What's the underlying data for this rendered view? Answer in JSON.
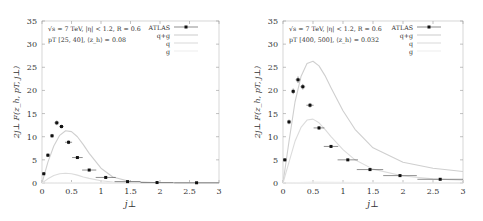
{
  "chart_data": [
    {
      "type": "scatter",
      "title": "",
      "annotation_line1": "√s = 7 TeV, |η| < 1.2, R = 0.6",
      "annotation_line2": "pT [25, 40], ⟨z_h⟩ = 0.08",
      "xlabel": "j⊥",
      "ylabel": "2j⊥ F(z_h, pT, j⊥)",
      "xlim": [
        0,
        3
      ],
      "ylim": [
        0,
        35
      ],
      "xticks": [
        "0",
        "0.5",
        "1",
        "1.5",
        "2",
        "2.5",
        "3"
      ],
      "yticks": [
        "0",
        "5",
        "10",
        "15",
        "20",
        "25",
        "30",
        "35"
      ],
      "legend": [
        "ATLAS",
        "q+g",
        "q",
        "g"
      ],
      "legend_position": "upper right",
      "series": [
        {
          "name": "ATLAS",
          "kind": "points-with-errors",
          "x": [
            0.03,
            0.1,
            0.17,
            0.25,
            0.33,
            0.45,
            0.6,
            0.8,
            1.08,
            1.45,
            1.95,
            2.62
          ],
          "y": [
            2.0,
            6.0,
            10.2,
            13.0,
            12.2,
            8.8,
            5.5,
            2.8,
            1.2,
            0.3,
            0.1,
            0.05
          ],
          "xerr": [
            0.03,
            0.03,
            0.03,
            0.04,
            0.04,
            0.06,
            0.09,
            0.12,
            0.17,
            0.22,
            0.28,
            0.38
          ],
          "yerr": [
            0.3,
            0.4,
            0.4,
            0.5,
            0.4,
            0.4,
            0.3,
            0.2,
            0.1,
            0.05,
            0.05,
            0.05
          ]
        },
        {
          "name": "q+g",
          "kind": "line",
          "x": [
            0,
            0.1,
            0.2,
            0.3,
            0.4,
            0.5,
            0.6,
            0.7,
            0.8,
            1.0,
            1.2,
            1.5,
            2.0,
            2.5,
            3.0
          ],
          "y": [
            0,
            4.5,
            8.0,
            10.3,
            11.3,
            11.1,
            10.0,
            8.3,
            6.4,
            3.2,
            1.3,
            0.3,
            0.05,
            0.01,
            0
          ]
        },
        {
          "name": "q",
          "kind": "line",
          "x": [
            0,
            0.1,
            0.2,
            0.3,
            0.4,
            0.5,
            0.6,
            0.7,
            0.8,
            1.0,
            1.2,
            1.5,
            2.0,
            3.0
          ],
          "y": [
            0,
            0.9,
            1.6,
            2.0,
            2.1,
            2.0,
            1.7,
            1.3,
            1.0,
            0.5,
            0.2,
            0.05,
            0,
            0
          ]
        },
        {
          "name": "g",
          "kind": "line",
          "x": [
            0,
            0.5,
            1.0,
            1.5,
            2.0,
            3.0
          ],
          "y": [
            0,
            0.1,
            0.05,
            0.01,
            0,
            0
          ]
        }
      ]
    },
    {
      "type": "scatter",
      "title": "",
      "annotation_line1": "√s = 7 TeV, |η| < 1.2, R = 0.6",
      "annotation_line2": "pT [400, 500], ⟨z_h⟩ = 0.032",
      "xlabel": "j⊥",
      "ylabel": "2j⊥ F(z_h, pT, j⊥)",
      "xlim": [
        0,
        3
      ],
      "ylim": [
        0,
        35
      ],
      "xticks": [
        "0",
        "0.5",
        "1",
        "1.5",
        "2",
        "2.5",
        "3"
      ],
      "yticks": [
        "0",
        "5",
        "10",
        "15",
        "20",
        "25",
        "30",
        "35"
      ],
      "legend": [
        "ATLAS",
        "q+g",
        "q",
        "g"
      ],
      "legend_position": "upper right",
      "series": [
        {
          "name": "ATLAS",
          "kind": "points-with-errors",
          "x": [
            0.03,
            0.1,
            0.17,
            0.25,
            0.33,
            0.45,
            0.6,
            0.8,
            1.08,
            1.45,
            1.95,
            2.62
          ],
          "y": [
            5.0,
            13.2,
            19.8,
            22.3,
            20.8,
            16.8,
            11.9,
            7.9,
            5.0,
            2.9,
            1.6,
            0.8
          ],
          "xerr": [
            0.03,
            0.03,
            0.03,
            0.04,
            0.04,
            0.06,
            0.09,
            0.12,
            0.17,
            0.22,
            0.28,
            0.38
          ],
          "yerr": [
            0.3,
            0.5,
            0.6,
            0.7,
            0.6,
            0.5,
            0.4,
            0.3,
            0.2,
            0.15,
            0.1,
            0.1
          ]
        },
        {
          "name": "q+g",
          "kind": "line",
          "x": [
            0,
            0.1,
            0.2,
            0.3,
            0.4,
            0.5,
            0.6,
            0.7,
            0.8,
            1.0,
            1.2,
            1.5,
            2.0,
            2.5,
            3.0
          ],
          "y": [
            0,
            9.0,
            17.5,
            23.0,
            25.8,
            26.3,
            25.3,
            23.2,
            20.6,
            15.6,
            11.6,
            7.6,
            4.5,
            3.2,
            2.5
          ]
        },
        {
          "name": "q",
          "kind": "line",
          "x": [
            0,
            0.1,
            0.2,
            0.3,
            0.4,
            0.5,
            0.6,
            0.7,
            0.8,
            1.0,
            1.2,
            1.5,
            2.0,
            2.5,
            3.0
          ],
          "y": [
            0,
            4.5,
            9.0,
            12.0,
            13.6,
            13.8,
            13.0,
            11.6,
            10.0,
            7.2,
            5.0,
            3.0,
            1.5,
            0.9,
            0.6
          ]
        },
        {
          "name": "g",
          "kind": "line",
          "x": [
            0,
            0.5,
            1.0,
            1.5,
            2.0,
            3.0
          ],
          "y": [
            0,
            0.2,
            0.15,
            0.05,
            0.02,
            0
          ]
        }
      ]
    }
  ]
}
